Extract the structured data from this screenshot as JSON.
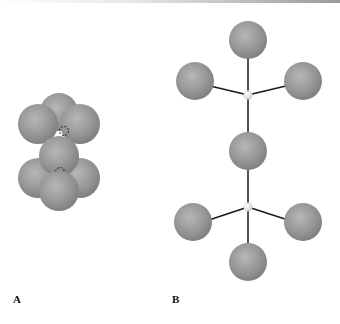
{
  "figure": {
    "panels": [
      {
        "id": "A",
        "label": "A",
        "description": "space-filling model"
      },
      {
        "id": "B",
        "label": "B",
        "description": "ball-and-stick model"
      }
    ],
    "colors": {
      "sphere_fill": "#8f8f8f",
      "sphere_highlight": "#b9b9b9",
      "bond": "#1a1a1a",
      "junction": "#e0e0e0"
    }
  }
}
